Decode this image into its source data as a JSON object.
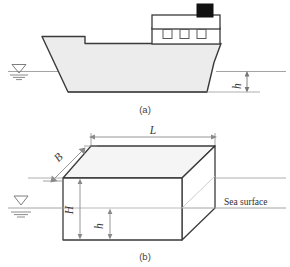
{
  "figure": {
    "panels": [
      {
        "id": "panel-a",
        "caption": "(a)",
        "description": "Ship floating on water, side elevation view",
        "labels": [
          {
            "name": "draft-depth",
            "text": "h"
          }
        ],
        "icons": [
          {
            "name": "water-level-icon",
            "text": ""
          }
        ]
      },
      {
        "id": "panel-b",
        "caption": "(b)",
        "description": "Rectangular box (barge) floating, isometric view",
        "labels": [
          {
            "name": "length-dimension",
            "text": "L"
          },
          {
            "name": "breadth-dimension",
            "text": "B"
          },
          {
            "name": "height-dimension",
            "text": "H"
          },
          {
            "name": "draft-dimension",
            "text": "h"
          },
          {
            "name": "sea-surface-label",
            "text": "Sea surface"
          }
        ]
      }
    ],
    "colors": {
      "outline": "#3a3a3a",
      "hull_fill": "#ececec",
      "top_fill": "#f2f2f2",
      "stack_fill": "#111111",
      "dimension_line": "#8a8a8a",
      "water_line": "#9a9a9a",
      "background": "#ffffff"
    }
  }
}
